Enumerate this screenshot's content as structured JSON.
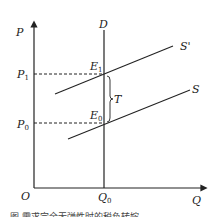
{
  "diagram": {
    "type": "supply-demand tax incidence",
    "axes": {
      "y_label": "P",
      "x_label": "Q",
      "origin_label": "O"
    },
    "curves": [
      {
        "name": "D",
        "label": "D",
        "kind": "vertical demand"
      },
      {
        "name": "S",
        "label": "S",
        "kind": "supply"
      },
      {
        "name": "S_prime",
        "label": "S'",
        "kind": "supply after tax"
      }
    ],
    "points": [
      {
        "name": "E1",
        "base": "E",
        "sub": "1"
      },
      {
        "name": "E0",
        "base": "E",
        "sub": "0"
      }
    ],
    "prices": [
      {
        "name": "P1",
        "base": "P",
        "sub": "1"
      },
      {
        "name": "P0",
        "base": "P",
        "sub": "0"
      }
    ],
    "quantity": {
      "name": "Q0",
      "base": "Q",
      "sub": "0"
    },
    "tax_label": "T",
    "caption": "图 需求完全无弹性时的税负转嫁"
  }
}
